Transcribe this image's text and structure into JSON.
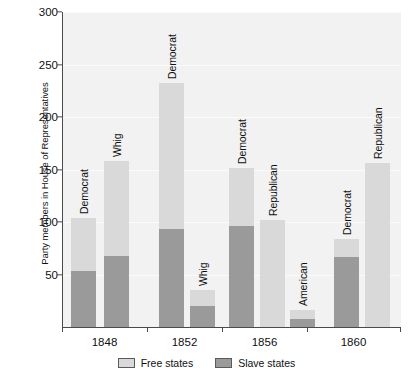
{
  "chart_data": {
    "type": "bar",
    "subtype": "grouped-stacked",
    "title": "",
    "xlabel": "",
    "ylabel": "Party members in House of Representatives",
    "ylim": [
      0,
      300
    ],
    "yticks": [
      50,
      100,
      150,
      200,
      250,
      300
    ],
    "grid": true,
    "legend_position": "bottom-center",
    "categories": [
      "1848",
      "1852",
      "1856",
      "1860"
    ],
    "series": [
      {
        "name": "Free states",
        "color": "#d9d9d9"
      },
      {
        "name": "Slave states",
        "color": "#9a9a9a"
      }
    ],
    "groups": [
      {
        "category": "1848",
        "bars": [
          {
            "party": "Democrat",
            "free": 51,
            "slave": 53,
            "total": 104
          },
          {
            "party": "Whig",
            "free": 90,
            "slave": 68,
            "total": 158
          }
        ]
      },
      {
        "category": "1852",
        "bars": [
          {
            "party": "Democrat",
            "free": 139,
            "slave": 93,
            "total": 232
          },
          {
            "party": "Whig",
            "free": 15,
            "slave": 20,
            "total": 35
          }
        ]
      },
      {
        "category": "1856",
        "bars": [
          {
            "party": "Democrat",
            "free": 55,
            "slave": 96,
            "total": 151
          },
          {
            "party": "Republican",
            "free": 102,
            "slave": 0,
            "total": 102
          },
          {
            "party": "American",
            "free": 8,
            "slave": 8,
            "total": 16
          }
        ]
      },
      {
        "category": "1860",
        "bars": [
          {
            "party": "Democrat",
            "free": 17,
            "slave": 67,
            "total": 84
          },
          {
            "party": "Republican",
            "free": 156,
            "slave": 0,
            "total": 156
          }
        ]
      }
    ]
  },
  "axis": {
    "y_title": "Party members in House of Representatives",
    "y_tick_labels": [
      "300",
      "250",
      "200",
      "150",
      "100",
      "50"
    ],
    "x_tick_labels": [
      "1848",
      "1852",
      "1856",
      "1860"
    ]
  },
  "legend": {
    "items": [
      {
        "label": "Free states",
        "color": "#d9d9d9"
      },
      {
        "label": "Slave states",
        "color": "#9a9a9a"
      }
    ]
  }
}
